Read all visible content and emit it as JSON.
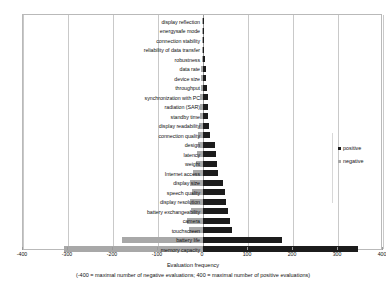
{
  "chart_data": {
    "type": "bar",
    "orientation": "horizontal",
    "style": "diverging",
    "title": "",
    "xlabel": "Evaluation frequency",
    "xlabel_note": "(-400 = maximal number of negative evaluations; 400 = maximal number of positive evaluations)",
    "ylabel": "",
    "xlim": [
      -400,
      400
    ],
    "xticks": [
      -400,
      -300,
      -200,
      -100,
      0,
      100,
      200,
      300,
      400
    ],
    "grid": true,
    "legend_position": "right",
    "colors": {
      "positive": "#1c1c1c",
      "negative": "#a8a8a8"
    },
    "categories": [
      "display reflection",
      "energysafe mode",
      "connection stability",
      "reliability of data transfer",
      "robustness",
      "data rate",
      "device size",
      "throughput",
      "synchronization with PC",
      "radiation (SAR)",
      "standby time",
      "display readability",
      "connection quality",
      "design",
      "latency",
      "weight",
      "Internet access",
      "display size",
      "speech quality",
      "display resolution",
      "battery exchangeability",
      "camera",
      "touchscreen",
      "battery life",
      "memory capacity"
    ],
    "series": [
      {
        "name": "positive",
        "values": [
          2,
          2,
          2,
          3,
          4,
          6,
          7,
          9,
          10,
          11,
          12,
          14,
          16,
          26,
          28,
          30,
          34,
          44,
          48,
          52,
          55,
          60,
          65,
          175,
          345
        ]
      },
      {
        "name": "negative",
        "values": [
          -2,
          -2,
          -2,
          -3,
          -3,
          -4,
          -4,
          -5,
          -6,
          -6,
          -7,
          -9,
          -11,
          -12,
          -14,
          -16,
          -22,
          -28,
          -24,
          -30,
          -26,
          -36,
          -32,
          -180,
          -310
        ]
      }
    ]
  },
  "legend": {
    "items": [
      {
        "label": "positive",
        "series": "positive"
      },
      {
        "label": "negative",
        "series": "negative"
      }
    ]
  },
  "axis": {
    "title": "Evaluation frequency",
    "subtitle": "(-400 = maximal number of negative evaluations; 400 = maximal number of positive evaluations)",
    "tick_labels": [
      "-400",
      "-300",
      "-200",
      "-100",
      "0",
      "100",
      "200",
      "300",
      "400"
    ]
  }
}
